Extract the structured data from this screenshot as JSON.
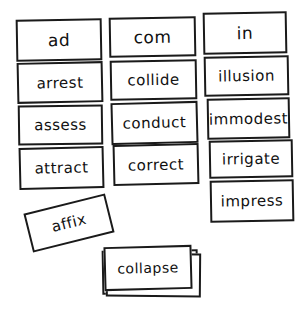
{
  "game": {
    "type": "word sort",
    "columns": [
      {
        "header": "ad",
        "words": [
          "arrest",
          "assess",
          "attract"
        ]
      },
      {
        "header": "com",
        "words": [
          "collide",
          "conduct",
          "correct"
        ]
      },
      {
        "header": "in",
        "words": [
          "illusion",
          "immodest",
          "irrigate",
          "impress"
        ]
      }
    ],
    "loose_card": "affix",
    "deck_top_card": "collapse"
  },
  "colors": {
    "card_border": "#1a1a1a",
    "card_fill": "#ffffff",
    "text": "#111111"
  }
}
